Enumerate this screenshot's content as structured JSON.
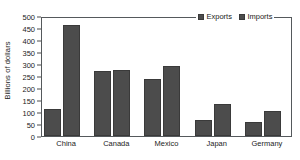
{
  "chart_data": {
    "type": "bar",
    "title": "",
    "subtitle": "",
    "xlabel": "",
    "ylabel": "Billions of dollars",
    "categories": [
      "China",
      "Canada",
      "Mexico",
      "Japan",
      "Germany"
    ],
    "series": [
      {
        "name": "Exports",
        "color": "#4c4c4c",
        "values": [
          112,
          271,
          238,
          67,
          58
        ]
      },
      {
        "name": "Imports",
        "color": "#4c4c4c",
        "values": [
          462,
          275,
          292,
          133,
          104
        ]
      }
    ],
    "ylim": [
      0,
      500
    ],
    "yticks": [
      0,
      50,
      100,
      150,
      200,
      250,
      300,
      350,
      400,
      450,
      500
    ],
    "ytick_labels": [
      "0",
      "50",
      "100",
      "150",
      "200",
      "250",
      "300",
      "350",
      "400",
      "450",
      "500"
    ],
    "grid": false,
    "legend_position": "top-right",
    "legend_entries": [
      "Exports",
      "Imports"
    ],
    "annotations": []
  },
  "axis": {
    "y_title": "Billions of dollars"
  },
  "legend": {
    "items": [
      {
        "label": "Exports",
        "swatch": "legend-swatch-exports"
      },
      {
        "label": "Imports",
        "swatch": "legend-swatch-imports"
      }
    ]
  }
}
